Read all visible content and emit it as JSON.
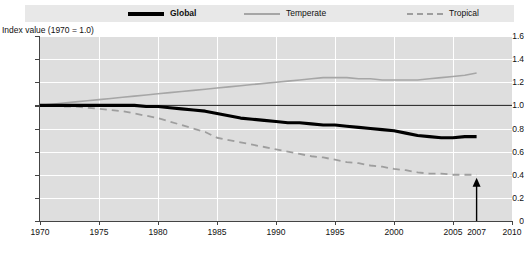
{
  "legend": {
    "items": [
      {
        "label": "Global",
        "style": "solid-bold",
        "color": "#000000",
        "icon": "line-swatch-icon"
      },
      {
        "label": "Temperate",
        "style": "solid-thin",
        "color": "#a6a6a6",
        "icon": "line-swatch-icon"
      },
      {
        "label": "Tropical",
        "style": "dashed",
        "color": "#9e9e9e",
        "icon": "dashed-line-swatch-icon"
      }
    ]
  },
  "axis_title": "Index value (1970 = 1.0)",
  "annotation": {
    "year_label": "2007",
    "arrow_icon": "up-arrow-icon"
  },
  "chart_data": {
    "type": "line",
    "title": "",
    "subtitle": "",
    "xlabel": "",
    "ylabel": "Index value (1970 = 1.0)",
    "xlim": [
      1970,
      2010
    ],
    "ylim": [
      0,
      1.6
    ],
    "grid": true,
    "legend_position": "top",
    "xticks": [
      1970,
      1975,
      1980,
      1985,
      1990,
      1995,
      2000,
      2005,
      2010
    ],
    "xtick_labels": [
      "1970",
      "1975",
      "1980",
      "1985",
      "1990",
      "1995",
      "2000",
      "2005",
      "2010"
    ],
    "extra_xtick": {
      "value": 2007,
      "label": "2007"
    },
    "yticks": [
      0,
      0.2,
      0.4,
      0.6,
      0.8,
      1.0,
      1.2,
      1.4,
      1.6
    ],
    "ytick_labels": [
      "0",
      "0.2",
      "0.4",
      "0.6",
      "0.8",
      "1.0",
      "1.2",
      "1.4",
      "1.6"
    ],
    "reference_line": {
      "y": 1.0,
      "color": "#1a1a1a",
      "style": "solid-thin"
    },
    "x": [
      1970,
      1971,
      1972,
      1973,
      1974,
      1975,
      1976,
      1977,
      1978,
      1979,
      1980,
      1981,
      1982,
      1983,
      1984,
      1985,
      1986,
      1987,
      1988,
      1989,
      1990,
      1991,
      1992,
      1993,
      1994,
      1995,
      1996,
      1997,
      1998,
      1999,
      2000,
      2001,
      2002,
      2003,
      2004,
      2005,
      2006,
      2007
    ],
    "series": [
      {
        "name": "Global",
        "color": "#000000",
        "style": "solid-bold",
        "values": [
          1.0,
          1.0,
          1.0,
          1.0,
          1.0,
          1.0,
          1.0,
          1.0,
          1.0,
          0.99,
          0.99,
          0.98,
          0.97,
          0.96,
          0.95,
          0.93,
          0.91,
          0.89,
          0.88,
          0.87,
          0.86,
          0.85,
          0.85,
          0.84,
          0.83,
          0.83,
          0.82,
          0.81,
          0.8,
          0.79,
          0.78,
          0.76,
          0.74,
          0.73,
          0.72,
          0.72,
          0.73,
          0.73
        ]
      },
      {
        "name": "Temperate",
        "color": "#a6a6a6",
        "style": "solid-thin",
        "values": [
          1.0,
          1.01,
          1.02,
          1.03,
          1.04,
          1.05,
          1.06,
          1.07,
          1.08,
          1.09,
          1.1,
          1.11,
          1.12,
          1.13,
          1.14,
          1.15,
          1.16,
          1.17,
          1.18,
          1.19,
          1.2,
          1.21,
          1.22,
          1.23,
          1.24,
          1.24,
          1.24,
          1.23,
          1.23,
          1.22,
          1.22,
          1.22,
          1.22,
          1.23,
          1.24,
          1.25,
          1.26,
          1.28
        ]
      },
      {
        "name": "Tropical",
        "color": "#9e9e9e",
        "style": "dashed",
        "values": [
          1.0,
          1.0,
          0.99,
          0.99,
          0.98,
          0.97,
          0.96,
          0.95,
          0.93,
          0.91,
          0.89,
          0.86,
          0.83,
          0.8,
          0.77,
          0.72,
          0.7,
          0.68,
          0.66,
          0.64,
          0.62,
          0.6,
          0.58,
          0.56,
          0.55,
          0.53,
          0.51,
          0.5,
          0.48,
          0.47,
          0.45,
          0.44,
          0.42,
          0.41,
          0.41,
          0.4,
          0.4,
          0.4
        ]
      }
    ]
  }
}
